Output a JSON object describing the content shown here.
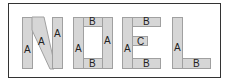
{
  "letters": [
    {
      "letter": "N",
      "pieces": [
        "A",
        "A",
        "A"
      ]
    },
    {
      "letter": "O",
      "pieces": [
        "A",
        "B",
        "A",
        "B"
      ]
    },
    {
      "letter": "E",
      "pieces": [
        "A",
        "B",
        "C",
        "B"
      ]
    },
    {
      "letter": "L",
      "pieces": [
        "A",
        "B"
      ]
    }
  ],
  "labels": {
    "n_left": "A",
    "n_diag": "A",
    "n_right": "A",
    "o_left": "A",
    "o_top": "B",
    "o_right": "A",
    "o_bottom": "B",
    "e_spine": "A",
    "e_top": "B",
    "e_mid": "C",
    "e_bottom": "B",
    "l_spine": "A",
    "l_bottom": "B"
  },
  "colors": {
    "fill": "#d6d6d6",
    "outline": "#a0a0a0",
    "frame": "#333333"
  }
}
